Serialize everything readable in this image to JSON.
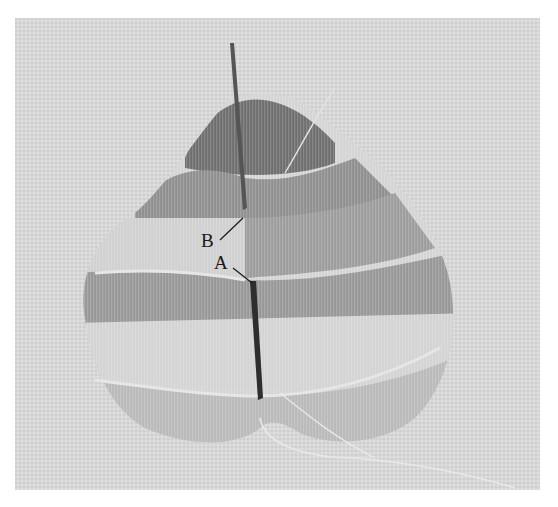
{
  "figure": {
    "labels": [
      {
        "id": "B",
        "text": "B"
      },
      {
        "id": "A",
        "text": "A"
      }
    ],
    "colors": {
      "background": "#ffffff",
      "fabric": "#d6d6d6",
      "dark_band": "#6a6a6a",
      "mid_band": "#9a9a9a",
      "light_band": "#b8b8b8",
      "needle": "#3a3a3a",
      "label_text": "#1a1a1a"
    }
  }
}
